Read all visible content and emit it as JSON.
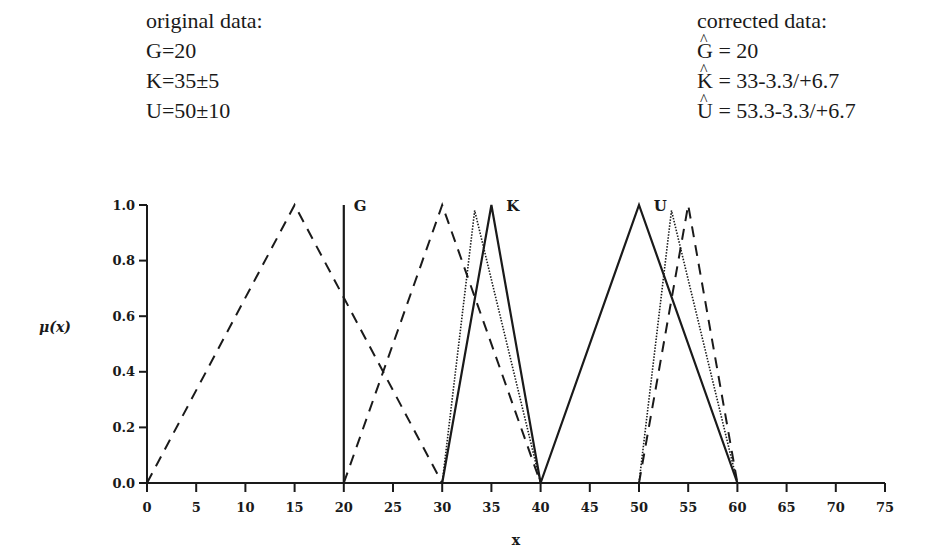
{
  "original": {
    "heading": "original data:",
    "lines": [
      "G=20",
      "K=35±5",
      "U=50±10"
    ]
  },
  "corrected": {
    "heading": "corrected data:",
    "lines": [
      {
        "symbol": "G",
        "value": " = 20"
      },
      {
        "symbol": "K",
        "value": " = 33-3.3/+6.7"
      },
      {
        "symbol": "U",
        "value": " = 53.3-3.3/+6.7"
      }
    ]
  },
  "chart_data": {
    "type": "line",
    "title": "",
    "xlabel": "x",
    "ylabel": "μ(x)",
    "xlim": [
      0,
      75
    ],
    "ylim": [
      0,
      1.0
    ],
    "x_ticks": [
      "0",
      "5",
      "10",
      "15",
      "20",
      "25",
      "30",
      "35",
      "40",
      "45",
      "50",
      "55",
      "60",
      "65",
      "70",
      "75"
    ],
    "y_ticks": [
      "0.0",
      "0.2",
      "0.4",
      "0.6",
      "0.8",
      "1.0"
    ],
    "grid": false,
    "legend": null,
    "annotations": [
      {
        "text": "G",
        "x": 21,
        "y": 1.0
      },
      {
        "text": "K",
        "x": 36.5,
        "y": 1.0
      },
      {
        "text": "U",
        "x": 51.5,
        "y": 1.0
      }
    ],
    "series": [
      {
        "name": "dashed-1",
        "style": "dashed",
        "x": [
          0,
          15,
          30
        ],
        "y": [
          0,
          1.0,
          0
        ]
      },
      {
        "name": "dashed-2",
        "style": "dashed",
        "x": [
          20,
          30,
          40
        ],
        "y": [
          0,
          1.0,
          0
        ]
      },
      {
        "name": "dashed-3",
        "style": "dashed",
        "x": [
          50,
          55,
          60
        ],
        "y": [
          0,
          1.0,
          0
        ]
      },
      {
        "name": "G",
        "style": "solid",
        "x": [
          20,
          20
        ],
        "y": [
          0,
          1.0
        ]
      },
      {
        "name": "K",
        "style": "solid",
        "x": [
          30,
          35,
          40
        ],
        "y": [
          0,
          1.0,
          0
        ]
      },
      {
        "name": "U",
        "style": "solid",
        "x": [
          40,
          50,
          60
        ],
        "y": [
          0,
          1.0,
          0
        ]
      },
      {
        "name": "K corrected",
        "style": "dotted",
        "x": [
          30,
          33.3,
          40
        ],
        "y": [
          0,
          0.98,
          0
        ]
      },
      {
        "name": "U corrected",
        "style": "dotted",
        "x": [
          50,
          53.3,
          60
        ],
        "y": [
          0,
          0.98,
          0
        ]
      }
    ]
  }
}
